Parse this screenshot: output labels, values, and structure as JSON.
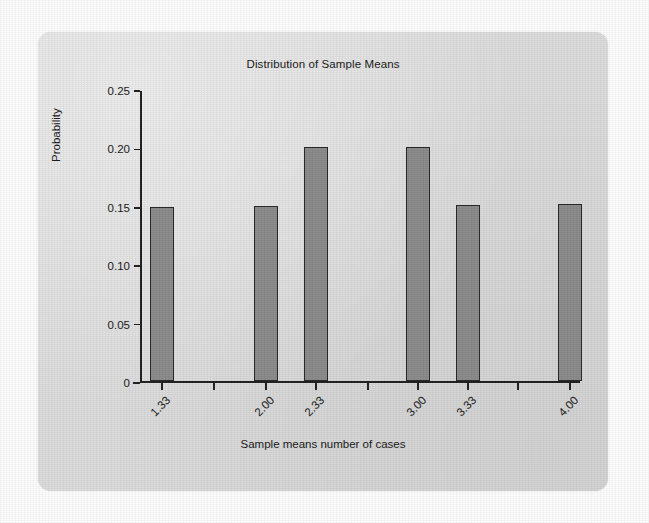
{
  "chart_data": {
    "type": "bar",
    "title": "Distribution of Sample Means",
    "xlabel": "Sample means number of cases",
    "ylabel": "Probability",
    "categories": [
      "1.33",
      "2.00",
      "2.33",
      "3.00",
      "3.33",
      "4.00"
    ],
    "values": [
      0.149,
      0.15,
      0.201,
      0.201,
      0.151,
      0.152
    ],
    "ylim": [
      0,
      0.25
    ],
    "ytick_labels": [
      "0",
      "0.05",
      "0.10",
      "0.15",
      "0.20",
      "0.25"
    ],
    "ytick_values": [
      0,
      0.05,
      0.1,
      0.15,
      0.2,
      0.25
    ],
    "xtick_labels": [
      "1.33",
      "2.00",
      "2.33",
      "3.00",
      "3.33",
      "4.00"
    ],
    "grid": false,
    "legend": "none",
    "bar_fill_color": "#8d8d8d",
    "bar_edge_color": "#2a2a2a",
    "axis_color": "#232323",
    "plot_background": "#dedede",
    "page_background": "#ffffff",
    "xlabel_rotation_deg": -45
  }
}
